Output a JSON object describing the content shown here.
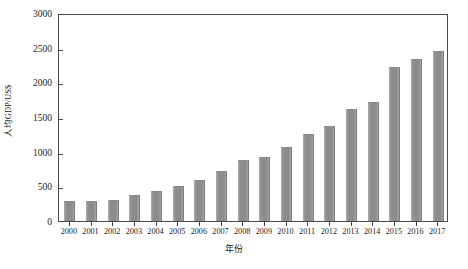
{
  "chart_data": {
    "type": "bar",
    "title": "",
    "xlabel": "年份",
    "ylabel": "人均GDP/US$",
    "categories": [
      "2000",
      "2001",
      "2002",
      "2003",
      "2004",
      "2005",
      "2006",
      "2007",
      "2008",
      "2009",
      "2010",
      "2011",
      "2012",
      "2013",
      "2014",
      "2015",
      "2016",
      "2017"
    ],
    "values": [
      290,
      290,
      300,
      370,
      440,
      510,
      590,
      720,
      880,
      920,
      1070,
      1250,
      1370,
      1620,
      1720,
      2220,
      2340,
      2450
    ],
    "series": [
      {
        "name": "人均GDP/US$",
        "values": [
          290,
          290,
          300,
          370,
          440,
          510,
          590,
          720,
          880,
          920,
          1070,
          1250,
          1370,
          1620,
          1720,
          2220,
          2340,
          2450
        ]
      }
    ],
    "ylim": [
      0,
      3000
    ],
    "yticks": [
      0,
      500,
      1000,
      1500,
      2000,
      2500,
      3000
    ],
    "ytick_labels": [
      "0",
      "500",
      "1000",
      "1500",
      "2000",
      "2500",
      "3000"
    ],
    "grid": false,
    "legend": "none",
    "bar_color": "#8c8c8c",
    "axis_color": "#4a4a4a",
    "background": "#ffffff"
  }
}
